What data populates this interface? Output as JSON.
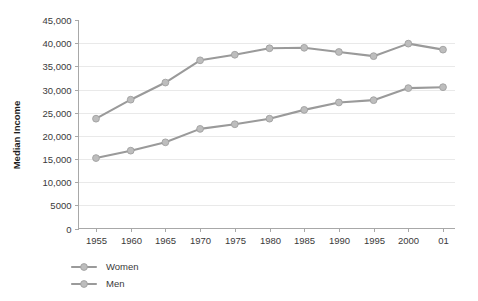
{
  "chart_data": {
    "type": "line",
    "title": "",
    "subtitle": "",
    "xlabel": "",
    "ylabel": "Median Income",
    "x": [
      "1955",
      "1960",
      "1965",
      "1970",
      "1975",
      "1980",
      "1985",
      "1990",
      "1995",
      "2000",
      "01"
    ],
    "categories": [
      "1955",
      "1960",
      "1965",
      "1970",
      "1975",
      "1980",
      "1985",
      "1990",
      "1995",
      "2000",
      "01"
    ],
    "series": [
      {
        "name": "Women",
        "color": "#bdbdbd",
        "values": [
          15200,
          16800,
          18600,
          21500,
          22500,
          23700,
          25600,
          27200,
          27700,
          30300,
          30500
        ]
      },
      {
        "name": "Men",
        "color": "#bdbdbd",
        "values": [
          23700,
          27800,
          31500,
          36300,
          37500,
          38900,
          39000,
          38100,
          37200,
          39900,
          38600
        ]
      }
    ],
    "ylim": [
      0,
      45000
    ],
    "ytick_values": [
      0,
      5000,
      10000,
      15000,
      20000,
      25000,
      30000,
      35000,
      40000,
      45000
    ],
    "ytick_labels": [
      "0",
      "5000",
      "10,000",
      "15,000",
      "20,000",
      "25,000",
      "30,000",
      "35,000",
      "40,000",
      "45,000"
    ],
    "grid": "horizontal",
    "grid_color": "#e9e9e9",
    "legend_position": "bottom-left",
    "legend_entries": [
      "Women",
      "Men"
    ],
    "line_color": "#9a9a9a",
    "marker_color": "#bdbdbd",
    "axis_color": "#a8a8a8",
    "background": "#ffffff"
  }
}
